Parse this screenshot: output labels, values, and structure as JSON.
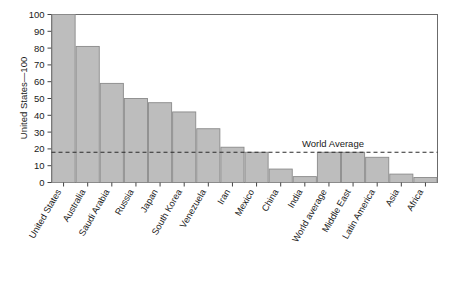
{
  "chart_data": {
    "type": "bar",
    "title": "",
    "xlabel": "",
    "ylabel": "United States—100",
    "ylim": [
      0,
      100
    ],
    "yticks": [
      0,
      10,
      20,
      30,
      40,
      50,
      60,
      70,
      80,
      90,
      100
    ],
    "ytick_labels": [
      "0",
      "10",
      "20",
      "30",
      "40",
      "50",
      "60",
      "70",
      "80",
      "90",
      "100"
    ],
    "grid": false,
    "legend": "none",
    "categories": [
      "United States",
      "Australia",
      "Saudi Arabia",
      "Russia",
      "Japan",
      "South Korea",
      "Venezuela",
      "Iran",
      "Mexico",
      "China",
      "India",
      "World average",
      "Middle East",
      "Latin America",
      "Asia",
      "Africa"
    ],
    "values": [
      100,
      81,
      59,
      50,
      47.5,
      42,
      32,
      21,
      18,
      8,
      3.5,
      18,
      18,
      15,
      5,
      3
    ],
    "annotations": [
      {
        "name": "world-average-line",
        "label": "World Average",
        "value": 18,
        "style": "dashed-horizontal"
      }
    ],
    "colors": {
      "bar_fill": "#bdbdbd",
      "bar_stroke": "#8a8a8a",
      "axis": "#555555",
      "text": "#1a1a1a",
      "background": "#ffffff"
    }
  }
}
